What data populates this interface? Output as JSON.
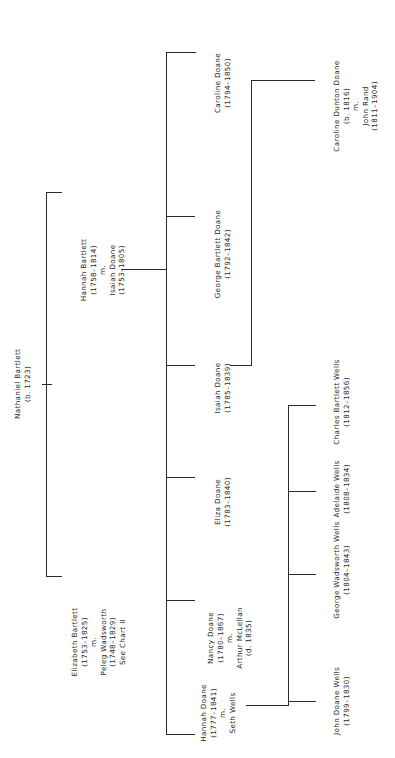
{
  "chart_title": "",
  "root": {
    "name": "Nathaniel Bartlett",
    "dates": "(b. 1723)"
  },
  "generation2": [
    {
      "name": "Hannah Bartlett",
      "dates": "(1758–1814)",
      "married_marker": "m.",
      "spouse": "Isaiah Doane",
      "spouse_dates": "(1753–1805)"
    },
    {
      "name": "Elizabeth Bartlett",
      "dates": "(1753–1825)",
      "married_marker": "m.",
      "spouse": "Peleg Wadsworth",
      "spouse_dates": "(1748–1829)",
      "note": "See Chart II"
    }
  ],
  "generation3": [
    {
      "name": "Caroline Doane",
      "dates": "(1794–1850)"
    },
    {
      "name": "George Bartlett Doane",
      "dates": "(1792–1842)"
    },
    {
      "name": "Isaiah Doane",
      "dates": "(1785–1839)"
    },
    {
      "name": "Eliza Doane",
      "dates": "(1783–1840)"
    },
    {
      "name": "Nancy Doane",
      "dates": "(1780–1867)",
      "married_marker": "m.",
      "spouse": "Arthur McLellan",
      "spouse_dates": "(d. 1835)"
    },
    {
      "name": "Hannah Doane",
      "dates": "(1777–1841)",
      "married_marker": "m.",
      "spouse": "Seth Wells"
    }
  ],
  "generation4_isaiah": [
    {
      "name": "Caroline Dunton Doane",
      "dates": "(b. 1816)",
      "married_marker": "m.",
      "spouse": "John Rand",
      "spouse_dates": "(1811–1904)"
    }
  ],
  "generation4_wells": [
    {
      "name": "Charles Bartlett Wells",
      "dates": "(1812–1856)"
    },
    {
      "name": "Adelaide Wells",
      "dates": "(1808–1834)"
    },
    {
      "name": "George Wadsworth Wells",
      "dates": "(1804–1843)"
    },
    {
      "name": "John Doane Wells",
      "dates": "(1799–1830)"
    }
  ],
  "colors": {
    "line": "#2a2a2a",
    "text": "#2a2a2a",
    "background": "#ffffff"
  }
}
